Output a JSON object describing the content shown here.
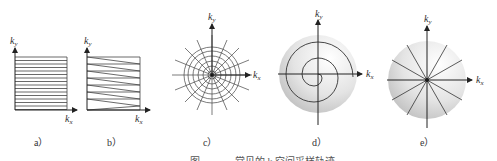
{
  "figure": {
    "caption_partial": "图 ——— 常见的 k 空间采样轨迹",
    "panels": [
      {
        "id": "a",
        "label": "a）",
        "type": "cartesian-raster",
        "description": "parallel horizontal lines",
        "axes": {
          "x": "k",
          "x_sub": "x",
          "y": "k",
          "y_sub": "y"
        }
      },
      {
        "id": "b",
        "label": "b）",
        "type": "zigzag-raster",
        "description": "zigzag (EPI-like) lines",
        "axes": {
          "x": "k",
          "x_sub": "x",
          "y": "k",
          "y_sub": "y"
        }
      },
      {
        "id": "c",
        "label": "c）",
        "type": "radial-concentric",
        "description": "concentric circles with radial spokes",
        "axes": {
          "x": "k",
          "x_sub": "x",
          "y": "k",
          "y_sub": "y"
        }
      },
      {
        "id": "d",
        "label": "d）",
        "type": "spiral",
        "description": "spiral trajectory over shaded disk",
        "axes": {
          "x": "k",
          "x_sub": "x",
          "y": "k",
          "y_sub": "y"
        }
      },
      {
        "id": "e",
        "label": "e）",
        "type": "radial",
        "description": "radial spokes over shaded disk",
        "axes": {
          "x": "k",
          "x_sub": "x",
          "y": "k",
          "y_sub": "y"
        }
      }
    ]
  }
}
